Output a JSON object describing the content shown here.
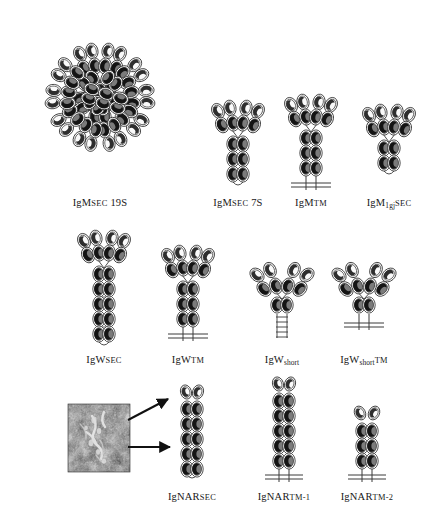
{
  "figure": {
    "kind": "scientific-diagram",
    "background_color": "#ffffff",
    "ink_color": "#1a1a1a",
    "domain_fill_dark": "#6e6e6e",
    "domain_fill_light": "#f2f2f2",
    "micrograph_present": true
  },
  "rows": [
    {
      "id": "row-igm",
      "panels": [
        {
          "id": "igm-sec-19s",
          "label_name": "IgM",
          "label_sub": "",
          "label_smallcaps": "SEC",
          "label_suffix": "19S",
          "label_plain": "IgM SEC 19S",
          "form": "pentamer",
          "monomers": 5,
          "arms": 2,
          "variable_domains_per_arm": 2,
          "constant_pairs_in_stem": 3,
          "membrane_anchored": false,
          "spring_tail": false
        },
        {
          "id": "igm-sec-7s",
          "label_name": "IgM",
          "label_sub": "",
          "label_smallcaps": "SEC",
          "label_suffix": "7S",
          "label_plain": "IgM SEC 7S",
          "form": "monomer",
          "monomers": 1,
          "arms": 2,
          "variable_domains_per_arm": 2,
          "constant_pairs_in_stem": 3,
          "membrane_anchored": false,
          "spring_tail": false
        },
        {
          "id": "igm-tm",
          "label_name": "IgM",
          "label_sub": "",
          "label_smallcaps": "TM",
          "label_suffix": "",
          "label_plain": "IgM TM",
          "form": "monomer",
          "monomers": 1,
          "arms": 2,
          "variable_domains_per_arm": 2,
          "constant_pairs_in_stem": 3,
          "membrane_anchored": true,
          "spring_tail": false
        },
        {
          "id": "igm-1gj-sec",
          "label_name": "IgM",
          "label_sub": "1gj",
          "label_smallcaps": "SEC",
          "label_suffix": "",
          "label_plain": "IgM1gj SEC",
          "form": "monomer",
          "monomers": 1,
          "arms": 2,
          "variable_domains_per_arm": 2,
          "constant_pairs_in_stem": 2,
          "membrane_anchored": false,
          "spring_tail": false
        }
      ]
    },
    {
      "id": "row-igw",
      "panels": [
        {
          "id": "igw-sec",
          "label_name": "IgW",
          "label_sub": "",
          "label_smallcaps": "SEC",
          "label_suffix": "",
          "label_plain": "IgW SEC",
          "form": "monomer",
          "monomers": 1,
          "arms": 2,
          "variable_domains_per_arm": 2,
          "constant_pairs_in_stem": 5,
          "membrane_anchored": false,
          "spring_tail": false
        },
        {
          "id": "igw-tm",
          "label_name": "IgW",
          "label_sub": "",
          "label_smallcaps": "TM",
          "label_suffix": "",
          "label_plain": "IgW TM",
          "form": "monomer",
          "monomers": 1,
          "arms": 2,
          "variable_domains_per_arm": 2,
          "constant_pairs_in_stem": 3,
          "membrane_anchored": true,
          "spring_tail": false
        },
        {
          "id": "igw-short",
          "label_name": "IgW",
          "label_sub": "short",
          "label_smallcaps": "",
          "label_suffix": "",
          "label_plain": "IgWshort",
          "form": "monomer",
          "monomers": 1,
          "arms": 2,
          "variable_domains_per_arm": 2,
          "constant_pairs_in_stem": 1,
          "membrane_anchored": false,
          "spring_tail": true
        },
        {
          "id": "igw-short-tm",
          "label_name": "IgW",
          "label_sub": "short",
          "label_smallcaps": "TM",
          "label_suffix": "",
          "label_plain": "IgWshort TM",
          "form": "monomer",
          "monomers": 1,
          "arms": 2,
          "variable_domains_per_arm": 2,
          "constant_pairs_in_stem": 1,
          "membrane_anchored": true,
          "spring_tail": false
        }
      ]
    },
    {
      "id": "row-ignar",
      "panels": [
        {
          "id": "ignar-sec",
          "label_name": "IgNAR",
          "label_sub": "",
          "label_smallcaps": "SEC",
          "label_suffix": "",
          "label_plain": "IgNAR SEC",
          "form": "column",
          "monomers": 1,
          "arms": 0,
          "variable_domains_per_arm": 1,
          "constant_pairs_in_stem": 5,
          "membrane_anchored": false,
          "spring_tail": false
        },
        {
          "id": "ignar-tm-1",
          "label_name": "IgNAR",
          "label_sub": "",
          "label_smallcaps": "TM-1",
          "label_suffix": "",
          "label_plain": "IgNAR TM-1",
          "form": "column",
          "monomers": 1,
          "arms": 0,
          "variable_domains_per_arm": 1,
          "constant_pairs_in_stem": 5,
          "membrane_anchored": true,
          "spring_tail": false
        },
        {
          "id": "ignar-tm-2",
          "label_name": "IgNAR",
          "label_sub": "",
          "label_smallcaps": "TM-2",
          "label_suffix": "",
          "label_plain": "IgNAR TM-2",
          "form": "column",
          "monomers": 1,
          "arms": 0,
          "variable_domains_per_arm": 1,
          "constant_pairs_in_stem": 3,
          "membrane_anchored": true,
          "spring_tail": false
        }
      ]
    }
  ],
  "micrograph": {
    "id": "electron-micrograph",
    "description": "electron micrograph inset",
    "arrows": 2
  }
}
